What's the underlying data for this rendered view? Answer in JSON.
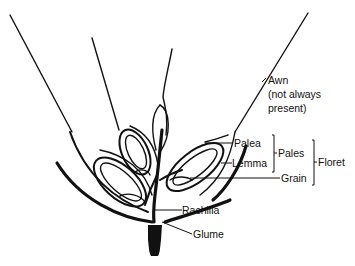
{
  "diagram": {
    "labels": {
      "awn_line1": "Awn",
      "awn_line2": "(not always",
      "awn_line3": "present)",
      "palea": "Palea",
      "lemma": "Lemma",
      "pales": "Pales",
      "grain": "Grain",
      "floret": "Floret",
      "rachilla": "Rachilla",
      "glume": "Glume"
    },
    "colors": {
      "ink": "#111111",
      "background": "#ffffff"
    }
  }
}
